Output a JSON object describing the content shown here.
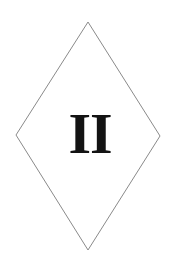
{
  "card": {
    "background_color": "#ffffff",
    "width": 180,
    "height": 264
  },
  "shape": {
    "name": "diamond-outline",
    "kind": "rhombus",
    "stroke_color": "#8a8a8a",
    "stroke_width": 1,
    "fill": "none",
    "points": "88,22 160,136 88,250 16,135",
    "vertices": {
      "top": [
        88,
        22
      ],
      "right": [
        160,
        136
      ],
      "bottom": [
        88,
        250
      ],
      "left": [
        16,
        135
      ]
    }
  },
  "symbol": {
    "name": "roman-numeral-two-glyph",
    "text": "II",
    "color": "#131313",
    "description": "bold serif Roman numeral two"
  }
}
